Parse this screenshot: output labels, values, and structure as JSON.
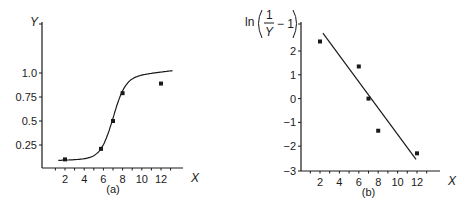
{
  "chart_data": [
    {
      "type": "scatter",
      "panel": "(a)",
      "title": "",
      "xlabel": "X",
      "ylabel": "Y",
      "xticks": [
        2,
        4,
        6,
        8,
        10,
        12
      ],
      "yticks": [
        "0.25",
        "0.5",
        "0.75",
        "1.0"
      ],
      "ytick_values": [
        0.25,
        0.5,
        0.75,
        1.0
      ],
      "xlim": [
        0,
        14
      ],
      "ylim": [
        0,
        1.4
      ],
      "grid": false,
      "points": [
        {
          "x": 2,
          "y": 0.1
        },
        {
          "x": 5.75,
          "y": 0.21
        },
        {
          "x": 7,
          "y": 0.5
        },
        {
          "x": 8,
          "y": 0.79
        },
        {
          "x": 12,
          "y": 0.89
        }
      ],
      "fit": {
        "type": "sigmoid curve",
        "description": "smooth logistic fit through points"
      }
    },
    {
      "type": "scatter",
      "panel": "(b)",
      "title": "",
      "xlabel": "X",
      "ylabel": "ln(1/Y − 1)",
      "ylabel_parts": {
        "fn": "ln",
        "num": "1",
        "den": "Y",
        "tail": "− 1"
      },
      "xticks": [
        2,
        4,
        6,
        8,
        10,
        12
      ],
      "yticks": [
        "2",
        "1",
        "0",
        "−1",
        "−2",
        "−3"
      ],
      "ytick_values": [
        2,
        1,
        0,
        -1,
        -2,
        -3
      ],
      "xlim": [
        0,
        14
      ],
      "ylim": [
        -3,
        3.8
      ],
      "grid": false,
      "points": [
        {
          "x": 2,
          "y": 2.4
        },
        {
          "x": 6,
          "y": 1.35
        },
        {
          "x": 7,
          "y": 0.0
        },
        {
          "x": 8,
          "y": -1.35
        },
        {
          "x": 12,
          "y": -2.3
        }
      ],
      "fit": {
        "type": "line",
        "from": {
          "x": 2.3,
          "y": 2.75
        },
        "to": {
          "x": 11.9,
          "y": -2.55
        }
      }
    }
  ]
}
